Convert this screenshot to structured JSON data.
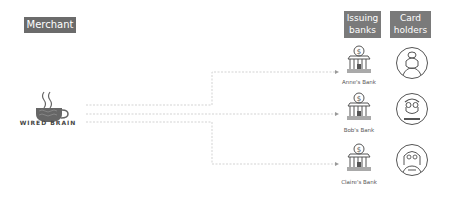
{
  "merchant": {
    "label": "Merchant",
    "logo_text": "WIRED BRAIN",
    "logo_icon": "coffee-cup-brain-icon"
  },
  "columns": {
    "issuing_banks": {
      "line1": "Issuing",
      "line2": "banks"
    },
    "card_holders": {
      "line1": "Card",
      "line2": "holders"
    }
  },
  "banks": [
    {
      "label": "Anne's Bank",
      "icon": "bank-dollar-icon"
    },
    {
      "label": "Bob's Bank",
      "icon": "bank-dollar-icon"
    },
    {
      "label": "Claire's Bank",
      "icon": "bank-dollar-icon"
    }
  ],
  "holders": [
    {
      "name": "Anne",
      "icon": "woman-avatar-icon"
    },
    {
      "name": "Bob",
      "icon": "man-glasses-avatar-icon"
    },
    {
      "name": "Claire",
      "icon": "woman-glasses-avatar-icon"
    }
  ],
  "colors": {
    "tag_bg": "#6b6b6b",
    "line": "#c8c8c8",
    "icon_stroke": "#555555"
  }
}
